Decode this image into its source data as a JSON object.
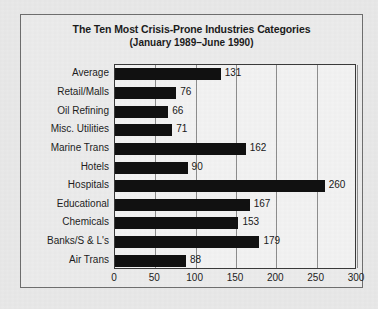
{
  "chart_data": {
    "type": "bar",
    "orientation": "horizontal",
    "title": "The Ten Most Crisis-Prone Industries Categories",
    "subtitle": "(January 1989–June 1990)",
    "xlabel": "",
    "ylabel": "",
    "xlim": [
      0,
      300
    ],
    "xticks": [
      "0",
      "50",
      "100",
      "150",
      "200",
      "250",
      "300"
    ],
    "grid": true,
    "legend": false,
    "bar_color": "#111111",
    "plot_background": "#f3f3f3",
    "categories": [
      "Average",
      "Retail/Malls",
      "Oil Refining",
      "Misc. Utilities",
      "Marine Trans",
      "Hotels",
      "Hospitals",
      "Educational",
      "Chemicals",
      "Banks/S & L's",
      "Air Trans"
    ],
    "values": [
      131,
      76,
      66,
      71,
      162,
      90,
      260,
      167,
      153,
      179,
      88
    ],
    "value_labels": [
      "131",
      "76",
      "66",
      "71",
      "162",
      "90",
      "260",
      "167",
      "153",
      "179",
      "88"
    ]
  }
}
